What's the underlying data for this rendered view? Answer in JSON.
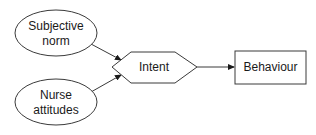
{
  "diagram": {
    "type": "flow",
    "nodes": {
      "subjective_norm": {
        "shape": "ellipse",
        "lines": [
          "Subjective",
          "norm"
        ]
      },
      "nurse_attitudes": {
        "shape": "ellipse",
        "lines": [
          "Nurse",
          "attitudes"
        ]
      },
      "intent": {
        "shape": "hexagon",
        "label": "Intent"
      },
      "behaviour": {
        "shape": "rectangle",
        "label": "Behaviour"
      }
    },
    "edges": [
      {
        "from": "Subjective norm",
        "to": "Intent"
      },
      {
        "from": "Nurse attitudes",
        "to": "Intent"
      },
      {
        "from": "Intent",
        "to": "Behaviour"
      }
    ],
    "colors": {
      "stroke": "#3a3a3a",
      "text": "#1a1a1a",
      "background": "#ffffff"
    }
  }
}
